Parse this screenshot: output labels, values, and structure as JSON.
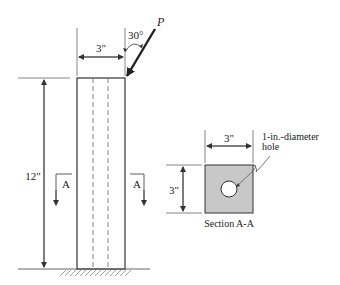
{
  "figure": {
    "type": "engineering-diagram",
    "colors": {
      "line": "#333333",
      "dim": "#555555",
      "section_fill": "#c8c8c8",
      "hatch": "#888888"
    }
  },
  "column": {
    "width_label": "3\"",
    "height_label": "12\"",
    "section_marker_left": "A",
    "section_marker_right": "A"
  },
  "load": {
    "symbol": "P",
    "angle_label": "30°"
  },
  "section": {
    "width_label": "3\"",
    "height_label": "3\"",
    "hole_label_line1": "1-in.-diameter",
    "hole_label_line2": "hole",
    "title": "Section A-A"
  }
}
